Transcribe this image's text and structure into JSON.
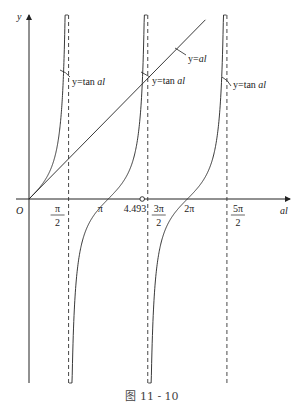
{
  "figure": {
    "caption": "图 11 - 10",
    "axes": {
      "x_label": "al",
      "y_label": "y",
      "origin_label": "O"
    },
    "x_ticks": [
      {
        "value": 1.5708,
        "num": "π",
        "den": "2",
        "fraction": true
      },
      {
        "value": 3.1416,
        "text": "π",
        "fraction": false
      },
      {
        "value": 4.493,
        "text": "4.493",
        "fraction": false,
        "marker": "open-circle"
      },
      {
        "value": 4.7124,
        "num": "3π",
        "den": "2",
        "fraction": true
      },
      {
        "value": 6.2832,
        "text": "2π",
        "fraction": false
      },
      {
        "value": 7.854,
        "num": "5π",
        "den": "2",
        "fraction": true
      }
    ],
    "asymptotes": [
      1.5708,
      4.7124,
      7.854
    ],
    "curves": [
      {
        "name": "y=tan al",
        "label": "y=tan al",
        "branch_center": 0
      },
      {
        "name": "y=tan al",
        "label": "y=tan al",
        "branch_center": 3.1416
      },
      {
        "name": "y=tan al",
        "label": "y=tan al",
        "branch_center": 6.2832
      },
      {
        "name": "y=al",
        "label": "y=al",
        "type": "line"
      }
    ],
    "intersection": {
      "x": 4.493,
      "description": "first nonzero root of tan al = al"
    }
  }
}
